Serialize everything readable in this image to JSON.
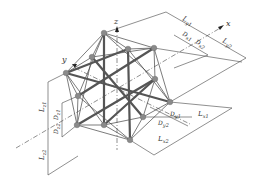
{
  "diagram": {
    "type": "isometric structural lattice with dimension annotations",
    "axes": {
      "x": "x",
      "y": "y",
      "z": "z"
    },
    "dimensions": {
      "top": [
        {
          "base": "L",
          "sub": "y1"
        },
        {
          "base": "L",
          "sub": "y2"
        },
        {
          "base": "D",
          "sub": "x1"
        },
        {
          "base": "D",
          "sub": "x2"
        }
      ],
      "right": [
        {
          "base": "L",
          "sub": "x1"
        },
        {
          "base": "L",
          "sub": "x2"
        },
        {
          "base": "D",
          "sub": "y1"
        },
        {
          "base": "D",
          "sub": "y2"
        }
      ],
      "left": [
        {
          "base": "L",
          "sub": "z1"
        },
        {
          "base": "L",
          "sub": "z2"
        },
        {
          "base": "D",
          "sub": "z1"
        },
        {
          "base": "D",
          "sub": "z2"
        }
      ]
    },
    "colors": {
      "line": "#333333",
      "thick_member": "#555555",
      "node": "#8a8a8a",
      "background": "#ffffff"
    }
  }
}
